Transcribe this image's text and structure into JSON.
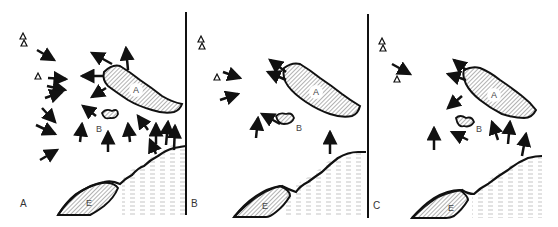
{
  "figure": {
    "panels": [
      {
        "id": "A",
        "label": "A",
        "landmarks": {
          "island_a": "A",
          "island_b": "B",
          "landmass_e": "E"
        }
      },
      {
        "id": "B",
        "label": "B",
        "landmarks": {
          "island_a": "A",
          "island_b": "B",
          "landmass_e": "E"
        }
      },
      {
        "id": "C",
        "label": "C",
        "landmarks": {
          "island_a": "A",
          "island_b": "B",
          "landmass_e": "E"
        }
      }
    ],
    "legend_symbols": {
      "triangle": "open-triangle-marker",
      "arrow": "direction-arrow",
      "hatched": "land-hatch",
      "dashed": "sea-dash"
    },
    "colors": {
      "ink": "#111111",
      "hatch": "#555555",
      "sea_dash": "#aaaaaa",
      "background": "#ffffff"
    }
  }
}
